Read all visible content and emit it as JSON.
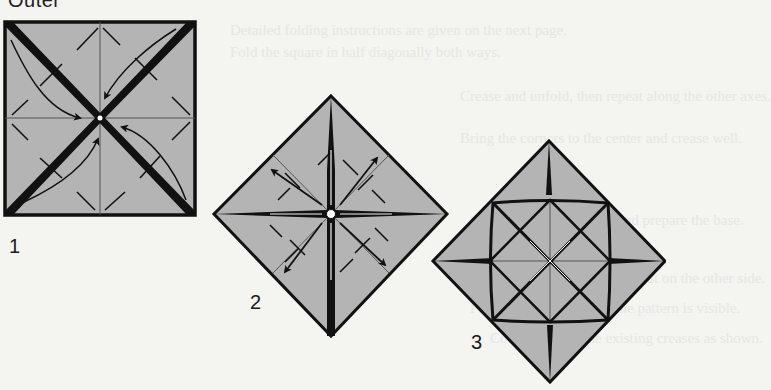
{
  "heading": "Outer",
  "ghost_text": [
    "Detailed folding instructions are given on the next page.",
    "Fold the square in half diagonally both ways.",
    "Crease and unfold, then repeat along the other axes.",
    "Bring the corners to the center and crease well.",
    "Open the folds back out and prepare the base.",
    "Turn the model over and repeat on the other side.",
    "Press the creases flat so the pattern is visible.",
    "Collapse along the existing creases as shown."
  ],
  "steps": [
    {
      "number": "1",
      "shape": "square",
      "description": "Square with diagonal valley folds and curved arrows toward center"
    },
    {
      "number": "2",
      "shape": "diamond",
      "description": "Diamond with mountain folds and outward arrows from center"
    },
    {
      "number": "3",
      "shape": "diamond",
      "description": "Diamond showing resulting crease pattern with inner square"
    }
  ],
  "colors": {
    "paper": "#b4b4b4",
    "line": "#111111",
    "background": "#f4f4f1"
  }
}
